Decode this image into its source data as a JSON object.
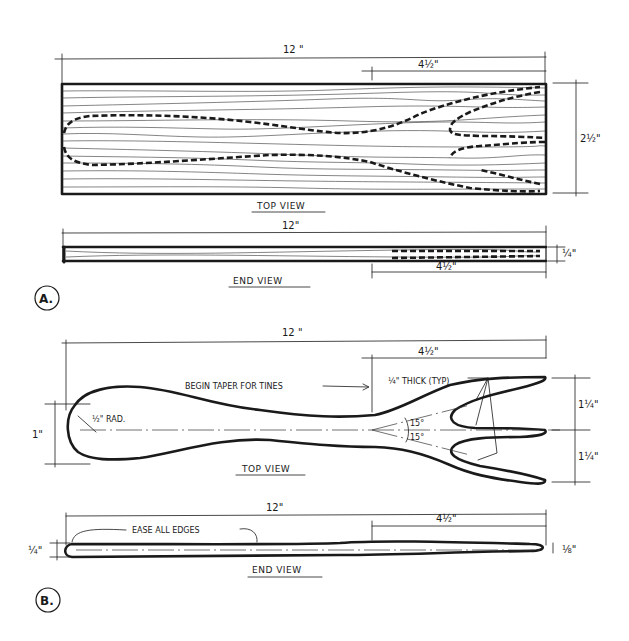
{
  "colors": {
    "ink": "#1a1a1a",
    "paper": "#ffffff"
  },
  "figure_a": {
    "label": "A.",
    "top_view": {
      "title": "TOP VIEW",
      "overall_length": "12 \"",
      "tine_length": "4½\"",
      "width": "2½\""
    },
    "end_view": {
      "title": "END VIEW",
      "overall_length": "12\"",
      "tine_length": "4½\"",
      "thickness": "¼\""
    }
  },
  "figure_b": {
    "label": "B.",
    "top_view": {
      "title": "TOP VIEW",
      "overall_length": "12 \"",
      "tine_length": "4½\"",
      "handle_width": "1\"",
      "handle_radius": "½\" RAD.",
      "taper_note": "BEGIN TAPER FOR TINES",
      "tine_thickness_note": "¼\" THICK (TYP)",
      "angle_upper": "15°",
      "angle_lower": "15°",
      "tine_spacing_upper": "1¼\"",
      "tine_spacing_lower": "1¼\""
    },
    "end_view": {
      "title": "END VIEW",
      "overall_length": "12\"",
      "tine_length": "4½\"",
      "edge_note": "EASE ALL EDGES",
      "handle_thickness": "¼\"",
      "tip_thickness": "⅛\""
    }
  }
}
